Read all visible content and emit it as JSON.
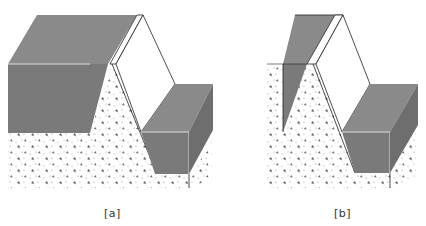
{
  "figures": [
    {
      "id": "a",
      "label": "[a]",
      "description": "Cross-section block diagram: large dark slab on ridge with trench and lower dark block, stippled ground"
    },
    {
      "id": "b",
      "label": "[b]",
      "description": "Cross-section block diagram: thin dark slab on ridge left flank with trench and lower dark block, stippled ground"
    }
  ],
  "colors": {
    "fill_dark": "#7a7a7a",
    "fill_top": "#8a8a8a",
    "ground": "#ffffff",
    "stroke": "#222222"
  }
}
